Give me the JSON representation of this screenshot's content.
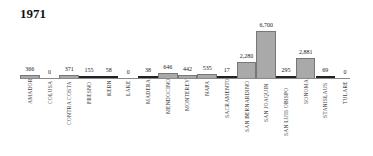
{
  "chart_data": {
    "type": "bar",
    "title": "1971",
    "xlabel": "",
    "ylabel": "",
    "categories": [
      "AMADOR",
      "COLUSA",
      "CONTRA COSTA",
      "FRESNO",
      "KERN",
      "LAKE",
      "MADERA",
      "MENDOCINO",
      "MONTEREY",
      "NAPA",
      "SACRAMENTO",
      "SAN BERNARDINO",
      "SAN JOAQUIN",
      "SAN LUIS OBISPO",
      "SONOMA",
      "STANISLAUS",
      "TULARE"
    ],
    "values": [
      366,
      0,
      371,
      155,
      58,
      0,
      38,
      646,
      442,
      535,
      17,
      2280,
      6700,
      295,
      2881,
      69,
      0
    ],
    "value_labels": [
      "366",
      "0",
      "371",
      "155",
      "58",
      "0",
      "38",
      "646",
      "442",
      "535",
      "17",
      "2,280",
      "6,700",
      "295",
      "2,881",
      "69",
      "0"
    ],
    "ylim": [
      0,
      6700
    ],
    "grid": false,
    "legend": null
  },
  "colors": {
    "bar": "#a9a9a9",
    "bar_dark": "#222222",
    "border": "#777777"
  }
}
